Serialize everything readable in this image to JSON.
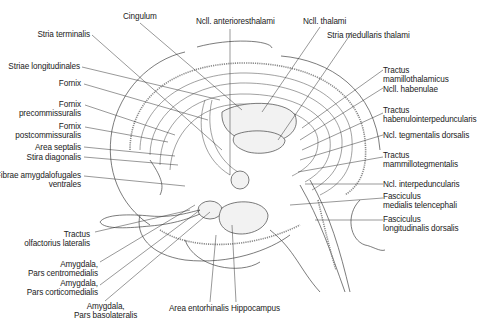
{
  "figure": {
    "type": "anatomical-diagram"
  },
  "labels": {
    "top": [
      {
        "id": "cingulum",
        "text": "Cingulum"
      },
      {
        "id": "ncl_anterior",
        "text": "Ncll. anterioresthalami"
      },
      {
        "id": "ncl_thalami",
        "text": "Ncll. thalami"
      },
      {
        "id": "stria_medullaris",
        "text": "Stria medullaris thalami"
      }
    ],
    "left": [
      {
        "id": "stria_terminalis",
        "lines": [
          "Stria terminalis"
        ]
      },
      {
        "id": "striae_longitudinales",
        "lines": [
          "Striae longitudinales"
        ]
      },
      {
        "id": "fornix",
        "lines": [
          "Fornix"
        ]
      },
      {
        "id": "fornix_pre",
        "lines": [
          "Fornix",
          "precommissuralis"
        ]
      },
      {
        "id": "fornix_post",
        "lines": [
          "Fornix",
          "postcommissuralis"
        ]
      },
      {
        "id": "area_septalis",
        "lines": [
          "Area septalis"
        ]
      },
      {
        "id": "stira_diagonalis",
        "lines": [
          "Stira diagonalis"
        ]
      },
      {
        "id": "fibrae_amygdalofugales",
        "lines": [
          "Fibrae amygdalofugales",
          "ventrales"
        ]
      },
      {
        "id": "tractus_olfactorius",
        "lines": [
          "Tractus",
          "olfactorius lateralis"
        ]
      },
      {
        "id": "amygdala_centro",
        "lines": [
          "Amygdala,",
          "Pars centromedialis"
        ]
      },
      {
        "id": "amygdala_cortico",
        "lines": [
          "Amygdala,",
          "Pars corticomedialis"
        ]
      },
      {
        "id": "amygdala_baso",
        "lines": [
          "Amygdala,",
          "Pars basolateralis"
        ]
      }
    ],
    "right": [
      {
        "id": "tractus_mamillothalamicus",
        "lines": [
          "Tractus",
          "mamillothalamicus"
        ]
      },
      {
        "id": "ncl_habenulae",
        "lines": [
          "Ncll. habenulae"
        ]
      },
      {
        "id": "tractus_habenulo",
        "lines": [
          "Tractus",
          "habenulointerpeduncularis"
        ]
      },
      {
        "id": "ncl_tegmentalis",
        "lines": [
          "Ncl. tegmentalis dorsalis"
        ]
      },
      {
        "id": "tractus_mammillotegmentalis",
        "lines": [
          "Tractus",
          "mammillotegmentalis"
        ]
      },
      {
        "id": "ncl_interpeduncularis",
        "lines": [
          "Ncl. interpeduncularis"
        ]
      },
      {
        "id": "fasciculus_medialis",
        "lines": [
          "Fasciculus",
          "medialis telencephali"
        ]
      },
      {
        "id": "fasciculus_longitudinalis",
        "lines": [
          "Fasciculus",
          "longitudinalis dorsalis"
        ]
      }
    ],
    "bottom": [
      {
        "id": "area_entorhinalis",
        "text": "Area entorhinalis"
      },
      {
        "id": "hippocampus",
        "text": "Hippocampus"
      }
    ]
  },
  "colors": {
    "background": "#ffffff",
    "line": "#444444",
    "text": "#222222"
  }
}
